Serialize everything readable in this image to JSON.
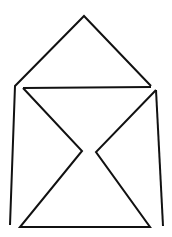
{
  "drawing": {
    "stroke": "#111111",
    "background": "#ffffff",
    "stroke_width": 2
  }
}
